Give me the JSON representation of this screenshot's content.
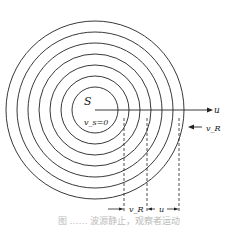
{
  "diagram": {
    "source_label": "S",
    "source_velocity_label": "v_s=0",
    "observer_velocity_label": "u",
    "wave_velocity_label": "v_R",
    "spacing_label_left": "v_R",
    "spacing_label_right": "u",
    "circle_count": 7,
    "caption": "图 …… 波源静止，观察者运动"
  }
}
